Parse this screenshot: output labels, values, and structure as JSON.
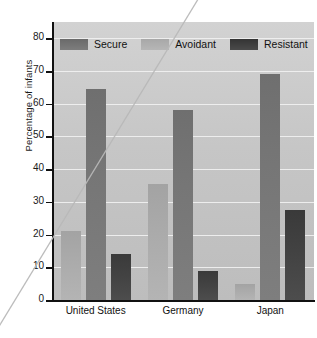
{
  "chart_data": {
    "type": "bar",
    "title": "",
    "xlabel": "",
    "ylabel": "Percentage of infants",
    "ylim": [
      0,
      85
    ],
    "yticks": [
      0,
      10,
      20,
      30,
      40,
      50,
      60,
      70,
      80
    ],
    "ytick_labels": [
      "0",
      "10",
      "20",
      "30",
      "40",
      "50",
      "60",
      "70",
      "80"
    ],
    "grid": true,
    "legend_position": "top-inside",
    "categories": [
      "United States",
      "Germany",
      "Japan"
    ],
    "series": [
      {
        "name": "Avoidant",
        "values": [
          21,
          35.5,
          5
        ],
        "color": "#ababab"
      },
      {
        "name": "Secure",
        "values": [
          64.5,
          58,
          69
        ],
        "color": "#767676"
      },
      {
        "name": "Resistant",
        "values": [
          14,
          9,
          27.5
        ],
        "color": "#424242"
      }
    ],
    "bar_order_in_group": [
      "Avoidant",
      "Secure",
      "Resistant"
    ],
    "legend_order": [
      "Secure",
      "Avoidant",
      "Resistant"
    ]
  },
  "legend": {
    "items": [
      {
        "label": "Secure",
        "key": "secure"
      },
      {
        "label": "Avoidant",
        "key": "avoidant"
      },
      {
        "label": "Resistant",
        "key": "resistant"
      }
    ]
  },
  "axes": {
    "y_title": "Percentage of infants"
  },
  "colors": {
    "plot_background": "#c9c9c9",
    "gridline": "#efefef",
    "axis": "#111111",
    "secure": "#767676",
    "avoidant": "#ababab",
    "resistant": "#424242"
  }
}
